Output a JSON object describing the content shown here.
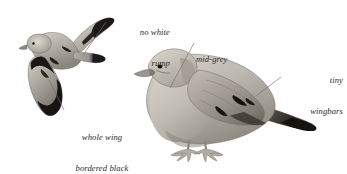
{
  "plate": {
    "width": 347,
    "height": 174,
    "background_color": "#ffffff",
    "subject": "dove-identification-plate",
    "ink_color": "#2b2b2b",
    "leader_line_color": "#6f6f6f"
  },
  "annotations": [
    {
      "id": "no-white-rump",
      "align": "right",
      "lines": [
        "no white",
        "rump"
      ],
      "leader": {
        "from_x": 106,
        "from_y": 22,
        "to_x": 83,
        "to_y": 55
      }
    },
    {
      "id": "whole-wing-bordered-black",
      "align": "center",
      "lines": [
        "whole wing",
        "bordered black"
      ],
      "leader": {
        "from_x": 64,
        "from_y": 110,
        "to_x": 49,
        "to_y": 80
      }
    },
    {
      "id": "mid-grey",
      "align": "left",
      "lines": [
        "mid-grey"
      ],
      "leader": {
        "from_x": 194,
        "from_y": 43,
        "to_x": 170,
        "to_y": 88
      }
    },
    {
      "id": "tiny-wingbars",
      "align": "right",
      "lines": [
        "tiny",
        "wingbars"
      ],
      "leader": {
        "from_x": 281,
        "from_y": 77,
        "to_x": 256,
        "to_y": 96
      }
    }
  ],
  "figures": [
    {
      "id": "dove-in-flight",
      "label": "dove in flight, viewed from below-side",
      "bbox": [
        16,
        16,
        106,
        106
      ],
      "palette": {
        "body_light": "#cbc6bd",
        "body_mid": "#a8a39a",
        "body_shadow": "#7d786f",
        "wing_black": "#1c1a18",
        "bill": "#8d877d",
        "eye": "#141210"
      }
    },
    {
      "id": "dove-perched",
      "label": "dove perched, side profile facing left",
      "bbox": [
        128,
        46,
        215,
        128
      ],
      "palette": {
        "body_light": "#c7c2b8",
        "body_mid": "#a9a49a",
        "body_shadow": "#858076",
        "wing_black": "#191715",
        "bill": "#9a948a",
        "eye": "#121110",
        "foot": "#b2ada3"
      }
    }
  ]
}
